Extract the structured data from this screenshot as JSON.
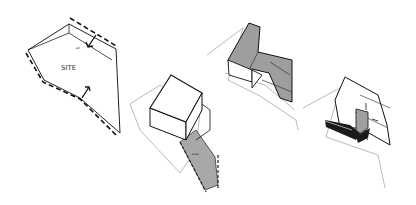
{
  "diagram": {
    "type": "architectural massing sequence",
    "panels": [
      {
        "id": 1,
        "name": "site",
        "label": "SITE",
        "small_label": "ad."
      },
      {
        "id": 2,
        "name": "block-volume",
        "small_label": "area"
      },
      {
        "id": 3,
        "name": "folded-roof-volume"
      },
      {
        "id": 4,
        "name": "courtyard-volume"
      }
    ],
    "colors": {
      "line": "#111111",
      "site_line": "#9a9a9a",
      "shade": "#9e9e9e",
      "dark": "#1a1a1a"
    }
  }
}
